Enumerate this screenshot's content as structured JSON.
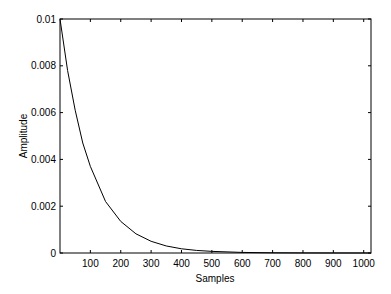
{
  "chart_data": {
    "type": "line",
    "title": "",
    "xlabel": "Samples",
    "ylabel": "Amplitude",
    "xlim": [
      0,
      1024
    ],
    "ylim": [
      0,
      0.01
    ],
    "grid": false,
    "legend": null,
    "x_ticks": [
      100,
      200,
      300,
      400,
      500,
      600,
      700,
      800,
      900,
      1000
    ],
    "x_tick_labels": [
      "100",
      "200",
      "300",
      "400",
      "500",
      "600",
      "700",
      "800",
      "900",
      "1000"
    ],
    "y_ticks": [
      0,
      0.002,
      0.004,
      0.006,
      0.008,
      0.01
    ],
    "y_tick_labels": [
      "0",
      "0.002",
      "0.004",
      "0.006",
      "0.008",
      "0.01"
    ],
    "series": [
      {
        "name": "exponential decay",
        "description": "approx. 0.01 * exp(-n/100)",
        "x": [
          0,
          25,
          50,
          75,
          100,
          150,
          200,
          250,
          300,
          350,
          400,
          450,
          500,
          600,
          700,
          800,
          900,
          1000,
          1024
        ],
        "y": [
          0.01,
          0.0078,
          0.0061,
          0.0047,
          0.0037,
          0.0022,
          0.00135,
          0.00082,
          0.0005,
          0.0003,
          0.00018,
          0.00011,
          7e-05,
          2.5e-05,
          9e-06,
          3e-06,
          1e-06,
          5e-07,
          4e-07
        ]
      }
    ]
  }
}
